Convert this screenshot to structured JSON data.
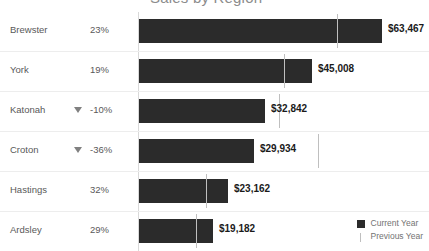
{
  "chart_data": {
    "type": "bar",
    "title": "Sales by Region",
    "xlabel": "",
    "ylabel": "",
    "categories": [
      "Brewster",
      "York",
      "Katonah",
      "Croton",
      "Hastings",
      "Ardsley"
    ],
    "values": [
      63467,
      45008,
      32842,
      29934,
      23162,
      19182
    ],
    "value_labels": [
      "$63,467",
      "$45,008",
      "$32,842",
      "$29,934",
      "$23,162",
      "$19,182"
    ],
    "percent_change": [
      "23%",
      "19%",
      "-10%",
      "-36%",
      "32%",
      "29%"
    ],
    "direction": [
      "up",
      "up",
      "down",
      "down",
      "up",
      "up"
    ],
    "previous_year": [
      51599,
      37822,
      36491,
      46772,
      17547,
      14870
    ],
    "legend": [
      {
        "label": "Current Year",
        "marker": "square",
        "color": "#2b2b2b"
      },
      {
        "label": "Previous Year",
        "marker": "line",
        "color": "#bfbfbf"
      }
    ],
    "legend_position": "bottom-right",
    "grid": false,
    "xlim": [
      0,
      67000
    ]
  },
  "rows": [
    {
      "category": "Brewster",
      "percent": "23%",
      "value_label": "$63,467",
      "bar_px": 243,
      "marker_px": 198,
      "show_triangle": false
    },
    {
      "category": "York",
      "percent": "19%",
      "value_label": "$45,008",
      "bar_px": 173,
      "marker_px": 145,
      "show_triangle": false
    },
    {
      "category": "Katonah",
      "percent": "-10%",
      "value_label": "$32,842",
      "bar_px": 126,
      "marker_px": 140,
      "show_triangle": true
    },
    {
      "category": "Croton",
      "percent": "-36%",
      "value_label": "$29,934",
      "bar_px": 115,
      "marker_px": 179,
      "show_triangle": true
    },
    {
      "category": "Hastings",
      "percent": "32%",
      "value_label": "$23,162",
      "bar_px": 89,
      "marker_px": 67,
      "show_triangle": false
    },
    {
      "category": "Ardsley",
      "percent": "29%",
      "value_label": "$19,182",
      "bar_px": 74,
      "marker_px": 57,
      "show_triangle": false
    }
  ],
  "title": {
    "text": "Sales by Region"
  },
  "legend": {
    "current_year": "Current Year",
    "previous_year": "Previous Year"
  },
  "colors": {
    "bar": "#2b2b2b",
    "marker": "#bfbfbf",
    "text": "#595959",
    "value_text": "#1a1a1a",
    "separator": "#ededed",
    "axis": "#d9d9d9"
  }
}
